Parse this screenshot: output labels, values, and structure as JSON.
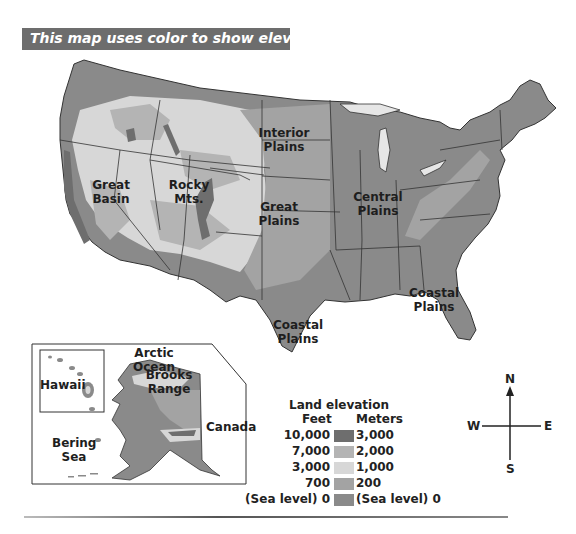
{
  "title": "This map uses color to show elevation.",
  "colors": {
    "title_bar": "#6d6d6d",
    "elev_3000m": "#6e6e6e",
    "elev_2000m": "#b4b4b4",
    "elev_1000m": "#d7d7d7",
    "elev_200m": "#a3a3a3",
    "elev_sea": "#8a8a8a",
    "state_border": "#333333"
  },
  "map_labels": {
    "interior_plains": [
      "Interior",
      "Plains"
    ],
    "great_basin": [
      "Great",
      "Basin"
    ],
    "rocky_mts": [
      "Rocky",
      "Mts."
    ],
    "great_plains": [
      "Great",
      "Plains"
    ],
    "central_plains": [
      "Central",
      "Plains"
    ],
    "coastal_plains_east": [
      "Coastal",
      "Plains"
    ],
    "coastal_plains_south": [
      "Coastal",
      "Plains"
    ]
  },
  "inset": {
    "arctic_ocean": "Arctic Ocean",
    "brooks_range": [
      "Brooks",
      "Range"
    ],
    "hawaii": "Hawaii",
    "canada": "Canada",
    "bering_sea": [
      "Bering",
      "Sea"
    ]
  },
  "legend": {
    "title": "Land elevation",
    "feet_header": "Feet",
    "meters_header": "Meters",
    "rows": [
      {
        "feet": "10,000",
        "meters": "3,000",
        "color": "#6e6e6e"
      },
      {
        "feet": "7,000",
        "meters": "2,000",
        "color": "#b4b4b4"
      },
      {
        "feet": "3,000",
        "meters": "1,000",
        "color": "#d7d7d7"
      },
      {
        "feet": "700",
        "meters": "200",
        "color": "#a3a3a3"
      },
      {
        "feet": "(Sea level) 0",
        "meters": "(Sea level) 0",
        "color": "#8a8a8a"
      }
    ]
  },
  "compass": {
    "n": "N",
    "s": "S",
    "e": "E",
    "w": "W"
  }
}
